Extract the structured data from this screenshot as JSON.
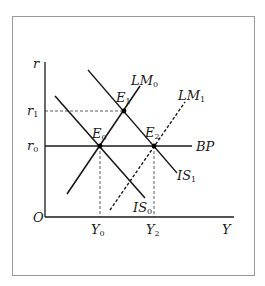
{
  "diagram": {
    "type": "IS-LM-BP",
    "axes": {
      "x_label": "Y",
      "y_label": "r",
      "origin_label": "O"
    },
    "y_ticks": [
      {
        "label": "r",
        "sub": "1"
      },
      {
        "label": "r",
        "sub": "0"
      }
    ],
    "x_ticks": [
      {
        "label": "Y",
        "sub": "0"
      },
      {
        "label": "Y",
        "sub": "2"
      }
    ],
    "curves": [
      {
        "name": "LM",
        "sub": "0",
        "style": "solid"
      },
      {
        "name": "LM",
        "sub": "1",
        "style": "dashed"
      },
      {
        "name": "IS",
        "sub": "0",
        "style": "solid"
      },
      {
        "name": "IS",
        "sub": "1",
        "style": "solid"
      },
      {
        "name": "BP",
        "sub": "",
        "style": "solid"
      }
    ],
    "points": [
      {
        "name": "E",
        "sub": "0"
      },
      {
        "name": "E",
        "sub": "1"
      },
      {
        "name": "E",
        "sub": "2"
      }
    ],
    "colors": {
      "line": "#1a1a1a",
      "frame": "#9a9a9a",
      "guide": "#333333"
    }
  }
}
